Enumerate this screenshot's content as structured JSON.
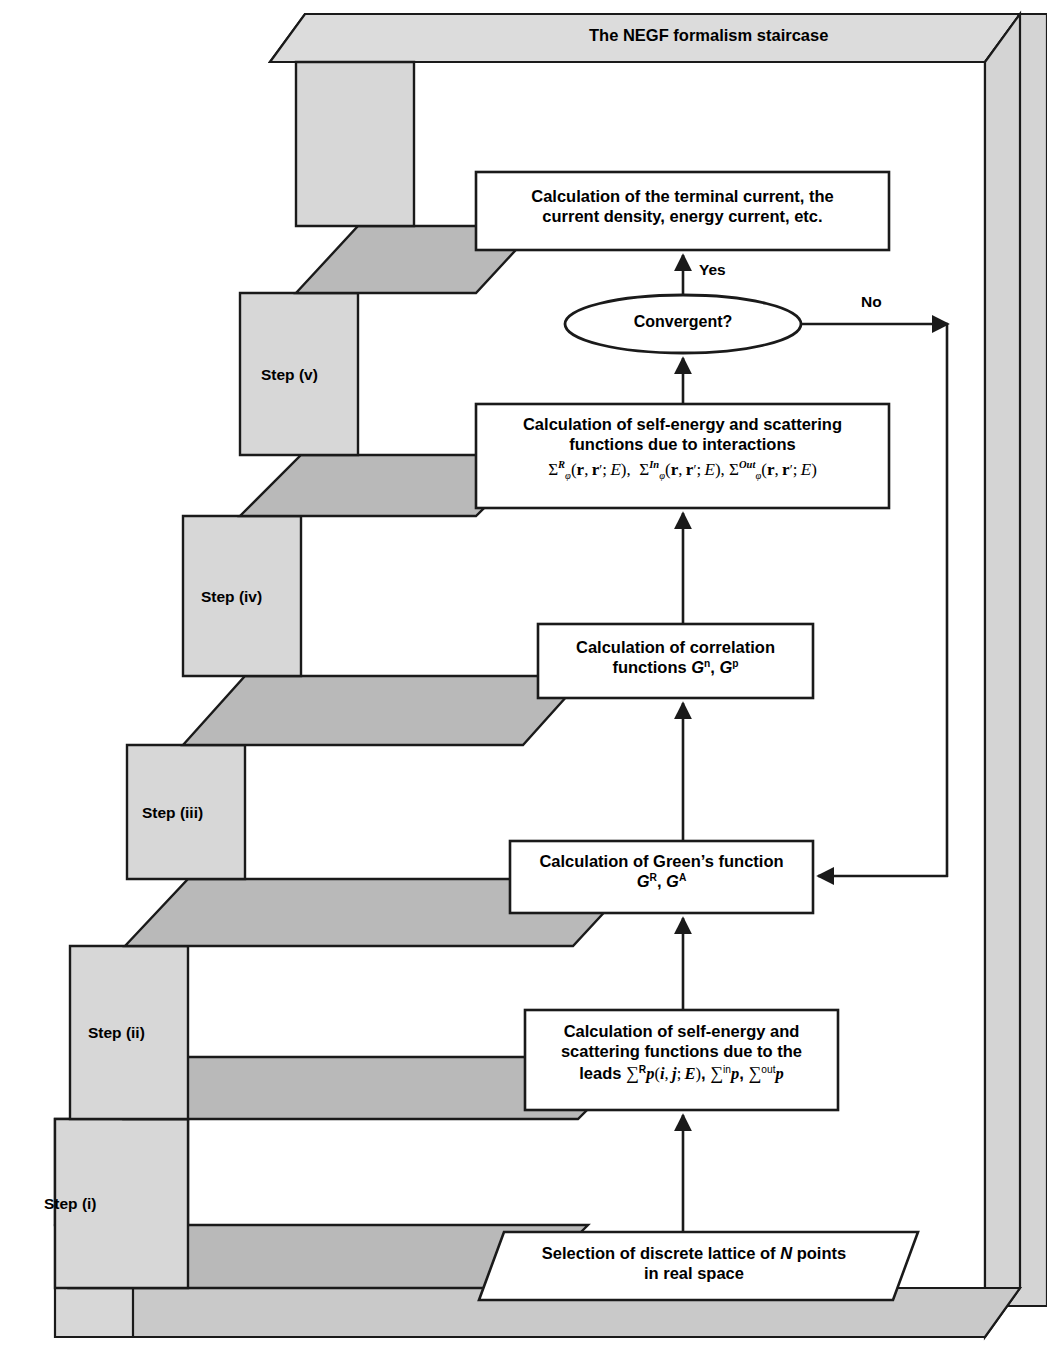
{
  "title": "The NEGF formalism staircase",
  "steps": [
    {
      "id": "step-v",
      "label": "Step (v)"
    },
    {
      "id": "step-iv",
      "label": "Step (iv)"
    },
    {
      "id": "step-iii",
      "label": "Step (iii)"
    },
    {
      "id": "step-ii",
      "label": "Step (ii)"
    },
    {
      "id": "step-i",
      "label": "Step (i)"
    }
  ],
  "boxes": {
    "terminal_current": {
      "line1": "Calculation of the terminal current, the",
      "line2": "current density, energy current, etc."
    },
    "self_energy_interactions": {
      "line1": "Calculation of self-energy and scattering",
      "line2": "functions due to interactions",
      "equation": "Σᴿφ(r, r′; E),  Σᴵⁿφ(r, r′; E), Σᴼᵘᵗφ(r, r′; E)"
    },
    "correlation_functions": {
      "line1": "Calculation of correlation",
      "line2": "functions Gⁿ, Gᵖ"
    },
    "greens_function": {
      "line1": "Calculation of Green’s function",
      "line2": "Gᴿ, Gᴬ"
    },
    "self_energy_leads": {
      "line1": "Calculation of self-energy and",
      "line2": "scattering functions  due to the",
      "line3": "leads Σᴿp(i, j; E), Σⁱⁿp, Σᵒᵘᵗp"
    },
    "lattice_selection": {
      "line1": "Selection of discrete lattice of N points",
      "line2": "in real space"
    }
  },
  "decision": {
    "label": "Convergent?",
    "yes_label": "Yes",
    "no_label": "No"
  },
  "colors": {
    "riser_fill": "#d7d7d7",
    "tread_fill": "#b9b9b9",
    "frame_fill": "#d4d4d4",
    "frame_top_fill": "#dcdcdc",
    "stroke": "#1a1a1a",
    "box_fill": "#ffffff"
  }
}
